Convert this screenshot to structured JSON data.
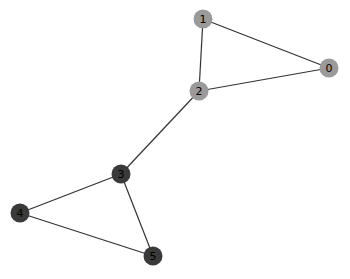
{
  "graph": {
    "type": "undirected-graph",
    "node_radius": 9.5,
    "colors": {
      "edge": "#333333",
      "group_a": "#9a9a9a",
      "group_b": "#3a3a3a",
      "label": "#000000"
    },
    "nodes": [
      {
        "id": "0",
        "label": "0",
        "x": 329,
        "y": 68,
        "group": "group_a"
      },
      {
        "id": "1",
        "label": "1",
        "x": 203,
        "y": 19,
        "group": "group_a"
      },
      {
        "id": "2",
        "label": "2",
        "x": 199,
        "y": 91,
        "group": "group_a"
      },
      {
        "id": "3",
        "label": "3",
        "x": 121,
        "y": 174,
        "group": "group_b"
      },
      {
        "id": "4",
        "label": "4",
        "x": 20,
        "y": 213,
        "group": "group_b"
      },
      {
        "id": "5",
        "label": "5",
        "x": 153,
        "y": 256,
        "group": "group_b"
      }
    ],
    "edges": [
      {
        "source": "0",
        "target": "1"
      },
      {
        "source": "0",
        "target": "2"
      },
      {
        "source": "1",
        "target": "2"
      },
      {
        "source": "2",
        "target": "3"
      },
      {
        "source": "3",
        "target": "4"
      },
      {
        "source": "3",
        "target": "5"
      },
      {
        "source": "4",
        "target": "5"
      }
    ]
  }
}
